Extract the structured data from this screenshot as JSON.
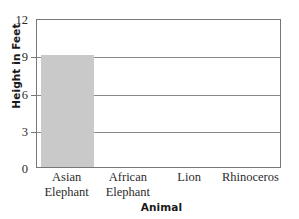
{
  "chart_data": {
    "type": "bar",
    "title": "",
    "xlabel": "Animal",
    "ylabel": "Height in Feet",
    "categories": [
      "Asian Elephant",
      "African Elephant",
      "Lion",
      "Rhinoceros"
    ],
    "values": [
      9,
      null,
      null,
      null
    ],
    "ylim": [
      0,
      12
    ],
    "yticks": [
      0,
      3,
      6,
      9,
      12
    ],
    "ytick_labels": [
      "0",
      "3",
      "6",
      "9",
      "12"
    ],
    "gridlines": [
      3,
      6,
      9
    ],
    "grid": true,
    "legend": "none",
    "series": [
      {
        "name": "Height in Feet",
        "values": [
          9,
          null,
          null,
          null
        ]
      }
    ],
    "bar_color": "#c9c9c9",
    "frame_color": "#777777",
    "grid_color": "#888888"
  },
  "axis": {
    "y_title": "Height in Feet",
    "x_title": "Animal"
  },
  "categories": [
    {
      "line1": "Asian",
      "line2": "Elephant"
    },
    {
      "line1": "African",
      "line2": "Elephant"
    },
    {
      "line1": "Lion",
      "line2": ""
    },
    {
      "line1": "Rhinoceros",
      "line2": ""
    }
  ],
  "yticks": [
    {
      "label": "12",
      "value": 12
    },
    {
      "label": "9",
      "value": 9
    },
    {
      "label": "6",
      "value": 6
    },
    {
      "label": "3",
      "value": 3
    },
    {
      "label": "0",
      "value": 0
    }
  ]
}
